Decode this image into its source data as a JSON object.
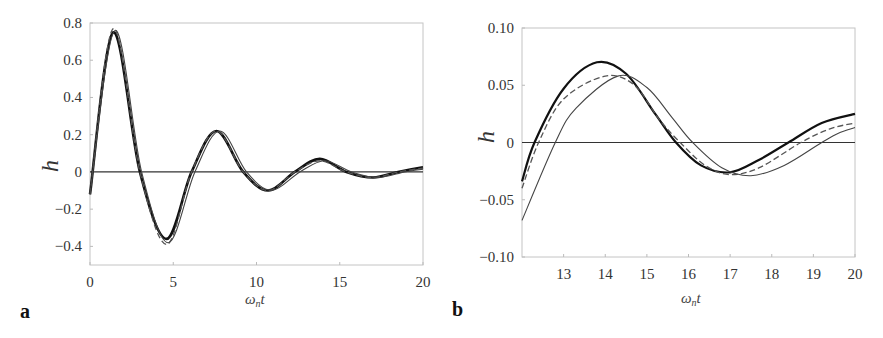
{
  "chart_data": [
    {
      "panel": "a",
      "type": "line",
      "title": "",
      "xlabel": "ωnt",
      "ylabel": "h",
      "xlim": [
        0,
        20
      ],
      "ylim": [
        -0.5,
        0.8
      ],
      "xticks": [
        "0",
        "5",
        "10",
        "15",
        "20"
      ],
      "yticks": [
        "0.8",
        "0.6",
        "0.4",
        "0.2",
        "0",
        "-0.2",
        "-0.4"
      ],
      "grid": false,
      "legend": null,
      "reference_line": {
        "y": 0
      },
      "series": [
        {
          "name": "thick solid",
          "style": "solid-thick",
          "x": [
            0,
            1.4,
            3.0,
            4.6,
            6.1,
            7.6,
            9.2,
            10.7,
            12.3,
            13.8,
            15.4,
            17.0,
            18.5,
            20
          ],
          "values": [
            -0.12,
            0.75,
            0.0,
            -0.36,
            0.0,
            0.22,
            0.0,
            -0.1,
            0.0,
            0.07,
            0.0,
            -0.03,
            0.0,
            0.025
          ]
        },
        {
          "name": "dashed",
          "style": "dashed",
          "x": [
            0,
            1.4,
            3.0,
            4.6,
            6.1,
            7.6,
            9.2,
            10.7,
            12.3,
            13.8,
            15.4,
            17.0,
            18.5,
            20
          ],
          "values": [
            -0.12,
            0.77,
            0.0,
            -0.39,
            0.0,
            0.22,
            0.0,
            -0.1,
            0.0,
            0.06,
            0.0,
            -0.03,
            0.0,
            0.02
          ]
        },
        {
          "name": "thin solid",
          "style": "solid-thin",
          "x": [
            0,
            1.5,
            3.1,
            4.7,
            6.3,
            7.8,
            9.4,
            10.9,
            12.6,
            14.1,
            15.7,
            17.3,
            18.9,
            20
          ],
          "values": [
            -0.12,
            0.76,
            0.0,
            -0.38,
            0.0,
            0.22,
            0.0,
            -0.1,
            0.0,
            0.06,
            0.0,
            -0.03,
            0.0,
            0.015
          ]
        }
      ]
    },
    {
      "panel": "b",
      "type": "line",
      "title": "",
      "xlabel": "ωnt",
      "ylabel": "h",
      "xlim": [
        12,
        20
      ],
      "ylim": [
        -0.1,
        0.1
      ],
      "xticks": [
        "13",
        "14",
        "15",
        "16",
        "17",
        "18",
        "19",
        "20"
      ],
      "yticks": [
        "0.10",
        "0.05",
        "0",
        "-0.05",
        "-0.10"
      ],
      "grid": false,
      "legend": null,
      "reference_line": {
        "y": 0
      },
      "series": [
        {
          "name": "thick solid",
          "style": "solid-thick",
          "x": [
            12,
            12.3,
            13,
            13.8,
            14.5,
            15.2,
            15.7,
            16.3,
            17.0,
            17.7,
            18.4,
            19.2,
            20
          ],
          "values": [
            -0.034,
            0.0,
            0.047,
            0.07,
            0.06,
            0.025,
            0.0,
            -0.02,
            -0.026,
            -0.015,
            0.0,
            0.017,
            0.025
          ]
        },
        {
          "name": "dashed",
          "style": "dashed",
          "x": [
            12,
            12.4,
            13,
            14.0,
            14.7,
            15.3,
            15.8,
            16.4,
            17.0,
            17.7,
            18.7,
            19.4,
            20
          ],
          "values": [
            -0.04,
            0.0,
            0.038,
            0.058,
            0.05,
            0.02,
            0.0,
            -0.02,
            -0.028,
            -0.022,
            0.0,
            0.012,
            0.017
          ]
        },
        {
          "name": "thin solid",
          "style": "solid-thin",
          "x": [
            12,
            12.8,
            13.3,
            14.3,
            15.0,
            15.6,
            16.1,
            16.8,
            17.5,
            18.3,
            19.2,
            19.6,
            20
          ],
          "values": [
            -0.068,
            0.0,
            0.03,
            0.058,
            0.048,
            0.022,
            0.0,
            -0.022,
            -0.029,
            -0.02,
            0.0,
            0.008,
            0.013
          ]
        }
      ]
    }
  ],
  "panels": {
    "a": {
      "label": "a",
      "xlabel_main": "ω",
      "xlabel_sub": "n",
      "xlabel_tail": "t",
      "ylabel": "h"
    },
    "b": {
      "label": "b",
      "xlabel_main": "ω",
      "xlabel_sub": "n",
      "xlabel_tail": "t",
      "ylabel": "h"
    }
  },
  "colors": {
    "thick": "#111111",
    "dashed": "#555555",
    "thin": "#444444",
    "axis": "#bbbbbb",
    "zero": "#333333"
  }
}
